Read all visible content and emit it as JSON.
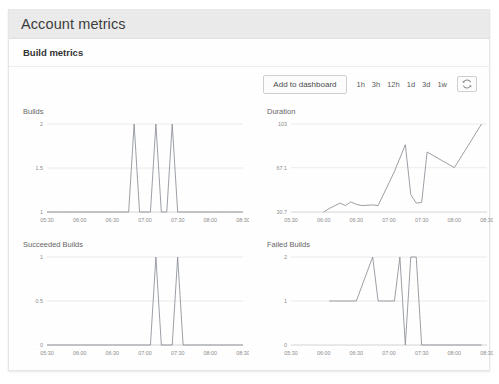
{
  "header": {
    "title": "Account metrics"
  },
  "panel": {
    "title": "Build metrics"
  },
  "toolbar": {
    "add_to_dashboard_label": "Add to dashboard",
    "ranges": [
      {
        "label": "1h"
      },
      {
        "label": "3h"
      },
      {
        "label": "12h"
      },
      {
        "label": "1d"
      },
      {
        "label": "3d"
      },
      {
        "label": "1w"
      }
    ],
    "refresh_icon": "refresh-icon"
  },
  "chart_data": [
    {
      "type": "line",
      "title": "Builds",
      "xlabel": "",
      "ylabel": "",
      "grid": true,
      "legend": "none",
      "ylim": [
        1,
        2
      ],
      "yticks": [
        1,
        1.5,
        2
      ],
      "ytick_labels": [
        "1",
        "1.5",
        "2"
      ],
      "xticks": [
        "05:30",
        "06:00",
        "06:30",
        "07:00",
        "07:30",
        "08:00",
        "08:30"
      ],
      "x": [
        "05:30",
        "05:45",
        "06:00",
        "06:15",
        "06:30",
        "06:45",
        "06:50",
        "06:55",
        "07:00",
        "07:05",
        "07:10",
        "07:15",
        "07:20",
        "07:25",
        "07:30",
        "07:45",
        "08:00",
        "08:15",
        "08:30"
      ],
      "values": [
        1,
        1,
        1,
        1,
        1,
        1,
        2,
        1,
        1,
        1,
        2,
        1,
        1,
        2,
        1,
        1,
        1,
        1,
        1
      ]
    },
    {
      "type": "line",
      "title": "Duration",
      "xlabel": "",
      "ylabel": "",
      "grid": true,
      "legend": "none",
      "ylim": [
        30.7,
        103
      ],
      "yticks": [
        30.7,
        67.1,
        103
      ],
      "ytick_labels": [
        "30.7",
        "67.1",
        "103"
      ],
      "xticks": [
        "05:30",
        "06:00",
        "06:30",
        "07:00",
        "07:30",
        "08:00",
        "08:30"
      ],
      "x": [
        "06:00",
        "06:05",
        "06:15",
        "06:20",
        "06:25",
        "06:30",
        "06:35",
        "06:45",
        "06:50",
        "07:05",
        "07:15",
        "07:20",
        "07:25",
        "07:30",
        "07:35",
        "08:00",
        "08:25"
      ],
      "values": [
        30.7,
        33.5,
        38.0,
        36.0,
        39.0,
        37.0,
        36.0,
        36.5,
        36.0,
        64.0,
        86.0,
        45.0,
        38.0,
        38.5,
        80.0,
        67.1,
        103
      ]
    },
    {
      "type": "line",
      "title": "Succeeded Builds",
      "xlabel": "",
      "ylabel": "",
      "grid": true,
      "legend": "none",
      "ylim": [
        0,
        1
      ],
      "yticks": [
        0,
        0.5,
        1
      ],
      "ytick_labels": [
        "0",
        "0.5",
        "1"
      ],
      "xticks": [
        "05:30",
        "06:00",
        "06:30",
        "07:00",
        "07:30",
        "08:00",
        "08:30"
      ],
      "x": [
        "05:30",
        "06:00",
        "06:30",
        "07:00",
        "07:05",
        "07:10",
        "07:15",
        "07:20",
        "07:25",
        "07:30",
        "07:35",
        "07:50",
        "08:30"
      ],
      "values": [
        0,
        0,
        0,
        0,
        0,
        1,
        0,
        0,
        0,
        1,
        0,
        0,
        0
      ]
    },
    {
      "type": "line",
      "title": "Failed Builds",
      "xlabel": "",
      "ylabel": "",
      "grid": true,
      "legend": "none",
      "ylim": [
        0,
        2
      ],
      "yticks": [
        0,
        1,
        2
      ],
      "ytick_labels": [
        "0",
        "1",
        "2"
      ],
      "xticks": [
        "05:30",
        "06:00",
        "06:30",
        "07:00",
        "07:30",
        "08:00",
        "08:30"
      ],
      "x": [
        "06:05",
        "06:10",
        "06:20",
        "06:30",
        "06:45",
        "06:50",
        "07:00",
        "07:05",
        "07:10",
        "07:15",
        "07:20",
        "07:25",
        "07:30",
        "07:35",
        "08:00",
        "08:25"
      ],
      "values": [
        1,
        1,
        1,
        1,
        2,
        1,
        1,
        1,
        2,
        0,
        2,
        2,
        0,
        0,
        0,
        0
      ]
    }
  ]
}
